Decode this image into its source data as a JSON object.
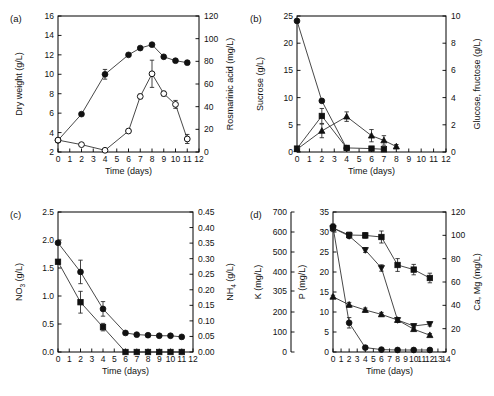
{
  "figure": {
    "width": 494,
    "height": 396,
    "background": "#ffffff",
    "marker_color": "#111111",
    "axis_color": "#000000"
  },
  "panels": [
    {
      "key": "a",
      "label": "(a)",
      "xlabel": "Time (days)",
      "ylabel_left": "Dry weight (g/L)",
      "ylabel_right": "Rosmarinic acid (mg/L)",
      "xticks": [
        0,
        1,
        2,
        3,
        4,
        5,
        6,
        7,
        8,
        9,
        10,
        11,
        12
      ],
      "yticks_left": [
        2,
        4,
        6,
        8,
        10,
        12,
        14,
        16
      ],
      "yticks_right": [
        0,
        20,
        40,
        60,
        80,
        100,
        120
      ]
    },
    {
      "key": "b",
      "label": "(b)",
      "xlabel": "Time (days)",
      "ylabel_left": "Sucrose (g/L)",
      "ylabel_right": "Glucose, fructose (g/L)",
      "xticks": [
        0,
        1,
        2,
        3,
        4,
        5,
        6,
        7,
        8,
        9,
        10,
        11,
        12
      ],
      "yticks_left": [
        0,
        5,
        10,
        15,
        20,
        25
      ],
      "yticks_right": [
        0,
        2,
        4,
        6,
        8,
        10
      ]
    },
    {
      "key": "c",
      "label": "(c)",
      "xlabel": "Time (days)",
      "ylabel_left": "NO3 (g/L)",
      "ylabel_right": "NH4 (g/L)",
      "xticks": [
        0,
        1,
        2,
        3,
        4,
        5,
        6,
        7,
        8,
        9,
        10,
        11,
        12
      ],
      "yticks_left": [
        "0.0",
        "0.5",
        "1.0",
        "1.5",
        "2.0",
        "2.5"
      ],
      "yticks_right": [
        "0.00",
        "0.05",
        "0.10",
        "0.15",
        "0.20",
        "0.25",
        "0.30",
        "0.35",
        "0.40",
        "0.45"
      ]
    },
    {
      "key": "d",
      "label": "(d)",
      "xlabel": "Time (days)",
      "ylabel_outer": "K (mg/L)",
      "ylabel_left": "P (mg/L)",
      "ylabel_right": "Ca, Mg (mg/L)",
      "xticks": [
        0,
        1,
        2,
        3,
        4,
        5,
        6,
        7,
        8,
        9,
        10,
        11,
        12,
        13,
        14
      ],
      "yticks_outer": [
        0,
        100,
        200,
        305,
        400,
        500,
        600,
        700
      ],
      "yticks_left": [
        0,
        5,
        10,
        15,
        20,
        25,
        30,
        35
      ],
      "yticks_right": [
        0,
        20,
        40,
        60,
        80,
        100,
        120
      ]
    }
  ],
  "chart_data": [
    {
      "type": "line",
      "panel": "a",
      "title": "(a)",
      "xlabel": "Time (days)",
      "ylabel": "Dry weight (g/L)",
      "ylabel2": "Rosmarinic acid (mg/L)",
      "xlim": [
        0,
        12
      ],
      "ylim": [
        2,
        16
      ],
      "ylim2": [
        0,
        120
      ],
      "grid": false,
      "legend": "none",
      "series": [
        {
          "name": "Dry weight",
          "marker": "filled-circle",
          "axis": "left",
          "x": [
            0,
            2,
            4,
            6,
            7,
            8,
            9,
            10,
            11
          ],
          "values": [
            3.2,
            5.9,
            10.0,
            12.0,
            12.7,
            13.05,
            11.8,
            11.4,
            11.2
          ],
          "errors": [
            0.1,
            0.15,
            0.5,
            0.15,
            0.1,
            0.15,
            0.15,
            0.15,
            0.2
          ]
        },
        {
          "name": "Rosmarinic acid",
          "marker": "open-circle",
          "axis": "right",
          "x": [
            0,
            2,
            4,
            6,
            7,
            8,
            9,
            10,
            11
          ],
          "values": [
            10.5,
            6.5,
            1.5,
            18.5,
            49.0,
            69.0,
            51.5,
            42.0,
            11.5
          ],
          "errors": [
            1.0,
            1.0,
            1.0,
            1.5,
            2.0,
            12.0,
            2.0,
            3.5,
            4.0
          ]
        }
      ]
    },
    {
      "type": "line",
      "panel": "b",
      "title": "(b)",
      "xlabel": "Time (days)",
      "ylabel": "Sucrose (g/L)",
      "ylabel2": "Glucose, fructose (g/L)",
      "xlim": [
        0,
        12
      ],
      "ylim": [
        0,
        25
      ],
      "ylim2": [
        0,
        10
      ],
      "grid": false,
      "legend": "none",
      "series": [
        {
          "name": "Sucrose",
          "marker": "filled-circle",
          "axis": "left",
          "x": [
            0,
            2,
            4
          ],
          "values": [
            24.1,
            9.4,
            0.7
          ],
          "errors": [
            0.2,
            0.3,
            0.2
          ]
        },
        {
          "name": "Glucose",
          "marker": "filled-square",
          "axis": "right",
          "x": [
            0,
            2,
            4,
            6,
            7
          ],
          "values": [
            0.25,
            2.65,
            0.3,
            0.25,
            0.2
          ],
          "errors": [
            0.1,
            0.55,
            0.15,
            0.1,
            0.1
          ]
        },
        {
          "name": "Fructose",
          "marker": "filled-triangle",
          "axis": "right",
          "x": [
            0,
            2,
            4,
            6,
            7,
            8
          ],
          "values": [
            0.2,
            1.55,
            2.6,
            1.2,
            0.85,
            0.4
          ],
          "errors": [
            0.1,
            0.5,
            0.35,
            0.45,
            0.35,
            0.15
          ]
        }
      ]
    },
    {
      "type": "line",
      "panel": "c",
      "title": "(c)",
      "xlabel": "Time (days)",
      "ylabel": "NO3 (g/L)",
      "ylabel2": "NH4 (g/L)",
      "xlim": [
        0,
        12
      ],
      "ylim": [
        0,
        2.5
      ],
      "ylim2": [
        0,
        0.45
      ],
      "grid": false,
      "legend": "none",
      "series": [
        {
          "name": "NO3",
          "marker": "filled-circle",
          "axis": "left",
          "x": [
            0,
            2,
            4,
            6,
            7,
            8,
            9,
            10,
            11
          ],
          "values": [
            1.95,
            1.43,
            0.77,
            0.34,
            0.31,
            0.3,
            0.29,
            0.29,
            0.27
          ],
          "errors": [
            0.03,
            0.21,
            0.13,
            0.02,
            0.02,
            0.02,
            0.02,
            0.02,
            0.02
          ]
        },
        {
          "name": "NH4",
          "marker": "filled-square",
          "axis": "right",
          "x": [
            0,
            2,
            4,
            6,
            7,
            8,
            9,
            10,
            11
          ],
          "values": [
            0.29,
            0.16,
            0.08,
            0.0,
            0.0,
            0.0,
            0.0,
            0.0,
            0.0
          ],
          "errors": [
            0.005,
            0.035,
            0.012,
            0.0,
            0.0,
            0.0,
            0.0,
            0.0,
            0.0
          ]
        }
      ]
    },
    {
      "type": "line",
      "panel": "d",
      "title": "(d)",
      "xlabel": "Time (days)",
      "ylabel_outer": "K (mg/L)",
      "ylabel": "P (mg/L)",
      "ylabel2": "Ca, Mg (mg/L)",
      "xlim": [
        0,
        14
      ],
      "ylim_outer": [
        0,
        700
      ],
      "ylim": [
        0,
        35
      ],
      "ylim2": [
        0,
        120
      ],
      "grid": false,
      "legend": "none",
      "series": [
        {
          "name": "K",
          "marker": "filled-square",
          "axis": "outer",
          "x": [
            0,
            2,
            4,
            6,
            8,
            10,
            12
          ],
          "values": [
            620,
            585,
            583,
            575,
            435,
            412,
            370
          ],
          "errors": [
            18,
            14,
            14,
            30,
            32,
            26,
            24
          ]
        },
        {
          "name": "P",
          "marker": "filled-circle",
          "axis": "left",
          "x": [
            0,
            2,
            4,
            6,
            8,
            10,
            12
          ],
          "values": [
            31.3,
            7.3,
            1.1,
            0.6,
            0.5,
            0.5,
            0.5
          ],
          "errors": [
            0.7,
            1.3,
            0.4,
            0.2,
            0.2,
            0.2,
            0.2
          ]
        },
        {
          "name": "Ca",
          "marker": "filled-down-triangle",
          "axis": "left",
          "x": [
            0,
            2,
            4,
            6,
            8,
            10,
            12
          ],
          "values": [
            31.0,
            29.0,
            25.5,
            21.0,
            8.0,
            6.5,
            7.0
          ],
          "errors": [
            0.6,
            0.6,
            0.6,
            0.8,
            0.6,
            0.5,
            0.5
          ]
        },
        {
          "name": "Mg",
          "marker": "filled-triangle",
          "axis": "left",
          "x": [
            0,
            2,
            4,
            6,
            8,
            10,
            12
          ],
          "values": [
            13.8,
            11.8,
            10.5,
            9.4,
            8.0,
            5.7,
            4.2
          ],
          "errors": [
            0.4,
            0.6,
            0.5,
            0.5,
            0.4,
            0.5,
            0.4
          ]
        }
      ]
    }
  ]
}
